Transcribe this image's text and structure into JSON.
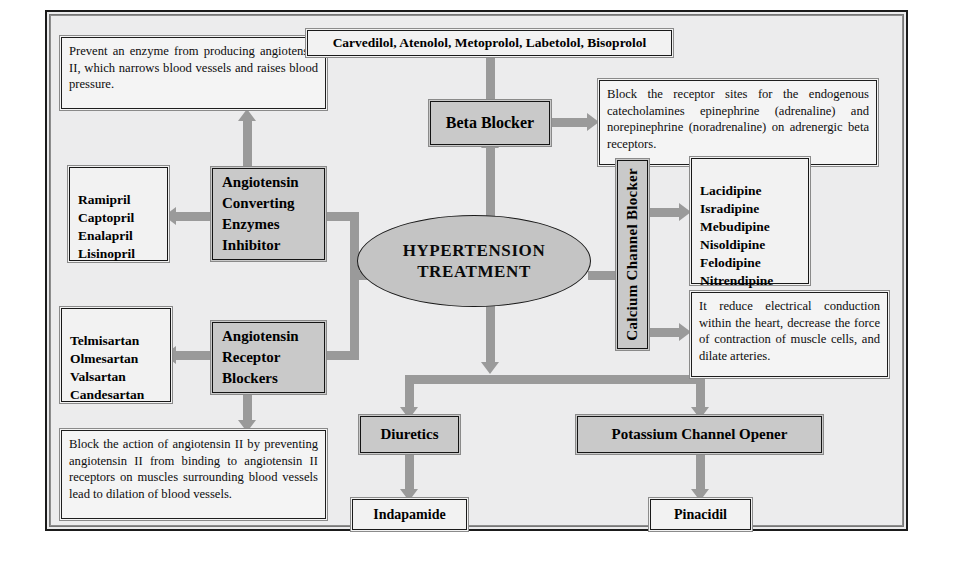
{
  "diagram": {
    "title": "Hypertension Treatment",
    "hub": "HYPERTENSION\nTREATMENT",
    "hub_line1": "HYPERTENSION",
    "hub_line2": "TREATMENT",
    "colors": {
      "category_fill": "#c9c9c9",
      "hub_fill": "#c4c4c4",
      "arrow": "#9a9a9a",
      "frame_border": "#1b1b1b",
      "canvas": "#ececed"
    }
  },
  "nodes": {
    "ace_desc": "Prevent an enzyme from producing angiotensin II, which narrows blood vessels and raises blood pressure.",
    "ace_drugs": "Ramipril\nCaptopril\nEnalapril\nLisinopril",
    "ace_drug_list": [
      "Ramipril",
      "Captopril",
      "Enalapril",
      "Lisinopril"
    ],
    "ace_category": "Angiotensin\nConverting\nEnzymes\nInhibitor",
    "ace_category_lines": [
      "Angiotensin",
      "Converting",
      "Enzymes",
      "Inhibitor"
    ],
    "beta_drugs": "Carvedilol,  Atenolol, Metoprolol, Labetolol, Bisoprolol",
    "beta_category": "Beta Blocker",
    "beta_desc": "Block the receptor sites for the endogenous catecholamines epinephrine (adrenaline) and norepinephrine (noradrenaline) on adrenergic beta receptors.",
    "ccb_category": "Calcium Channel Blocker",
    "ccb_drugs": "Lacidipine\nIsradipine\nMebudipine\nNisoldipine\nFelodipine\nNitrendipine",
    "ccb_drug_list": [
      "Lacidipine",
      "Isradipine",
      "Mebudipine",
      "Nisoldipine",
      "Felodipine",
      "Nitrendipine"
    ],
    "ccb_desc": "It reduce electrical conduction within the heart, decrease the force of contraction of muscle cells, and dilate arteries.",
    "arb_drugs": "Telmisartan\nOlmesartan\nValsartan\nCandesartan",
    "arb_drug_list": [
      "Telmisartan",
      "Olmesartan",
      "Valsartan",
      "Candesartan"
    ],
    "arb_category": "Angiotensin\nReceptor\nBlockers",
    "arb_category_lines": [
      "Angiotensin",
      "Receptor",
      "Blockers"
    ],
    "arb_desc": "Block the action of angiotensin II by preventing angiotensin II from binding to angiotensin II receptors on muscles surrounding blood vessels lead to dilation of blood vessels.",
    "diuretics_category": "Diuretics",
    "diuretics_drug": "Indapamide",
    "pco_category": "Potassium Channel Opener",
    "pco_drug": "Pinacidil"
  }
}
